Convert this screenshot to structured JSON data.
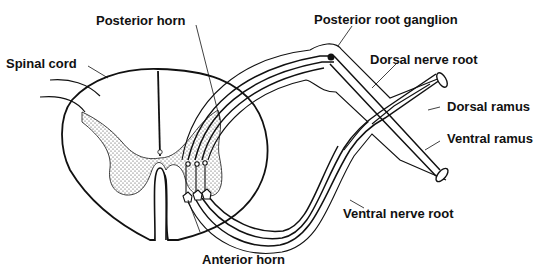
{
  "diagram": {
    "type": "anatomical-line-drawing",
    "colors": {
      "stroke": "#111111",
      "background": "#ffffff",
      "stipple": "#333333"
    },
    "labels": {
      "spinal_cord": "Spinal cord",
      "posterior_horn": "Posterior horn",
      "anterior_horn": "Anterior horn",
      "posterior_root_ganglion": "Posterior root ganglion",
      "dorsal_nerve_root": "Dorsal nerve root",
      "dorsal_ramus": "Dorsal ramus",
      "ventral_ramus": "Ventral ramus",
      "ventral_nerve_root": "Ventral nerve root"
    }
  }
}
